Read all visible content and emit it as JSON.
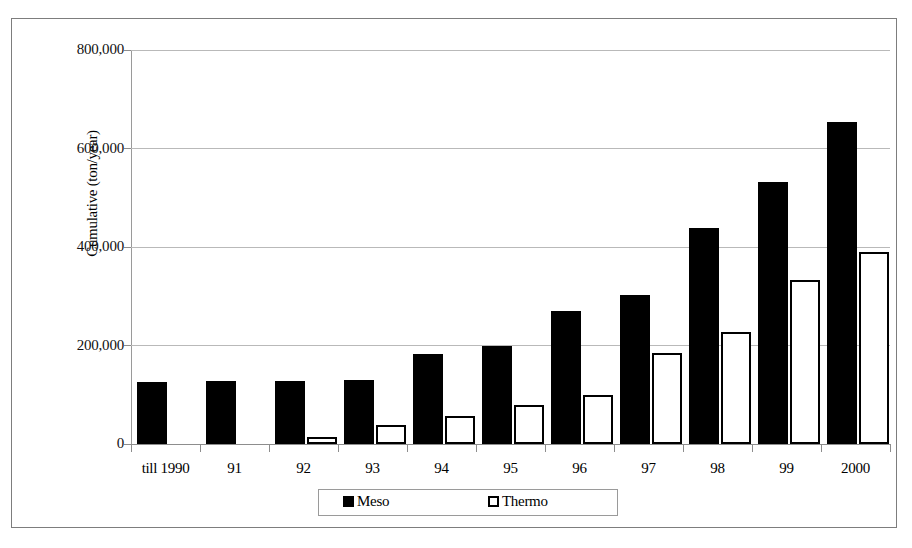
{
  "chart_data": {
    "type": "bar",
    "title": "",
    "xlabel": "",
    "ylabel": "Cumulative (ton/year)",
    "ylim": [
      0,
      800000
    ],
    "yticks": [
      0,
      200000,
      400000,
      600000,
      800000
    ],
    "ytick_labels": [
      "0",
      "200,000",
      "400,000",
      "600,000",
      "800,000"
    ],
    "grid": true,
    "legend_position": "bottom",
    "categories": [
      "till 1990",
      "91",
      "92",
      "93",
      "94",
      "95",
      "96",
      "97",
      "98",
      "99",
      "2000"
    ],
    "series": [
      {
        "name": "Meso",
        "color": "#000000",
        "style": "filled",
        "values": [
          126000,
          128000,
          128000,
          129000,
          183000,
          199000,
          270000,
          302000,
          439000,
          532000,
          654000
        ]
      },
      {
        "name": "Thermo",
        "color": "#ffffff",
        "style": "hollow",
        "values": [
          0,
          0,
          14000,
          38000,
          57000,
          79000,
          100000,
          185000,
          227000,
          334000,
          389000
        ]
      }
    ]
  },
  "legend": {
    "items": [
      {
        "label": "Meso",
        "swatch": "filled-square-icon"
      },
      {
        "label": "Thermo",
        "swatch": "hollow-square-icon"
      }
    ]
  }
}
